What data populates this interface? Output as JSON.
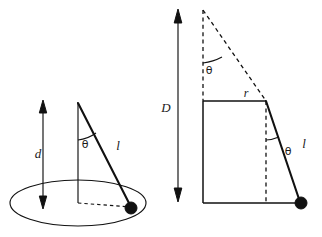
{
  "figure": {
    "background_color": "#ffffff",
    "ink_color": "#111111",
    "width": 322,
    "height": 237,
    "panels": [
      {
        "id": "left-panel",
        "name": "perspective-cone-view",
        "description": "Three-dimensional perspective view of a conical pendulum: a bob swings on a string of length l around a horizontal circular path, suspended a vertical depth d below the pivot, with the string making angle theta with the vertical axis.",
        "labels": [
          {
            "key": "depth",
            "text": "d",
            "kind": "italic-math",
            "x": 38,
            "y": 158
          },
          {
            "key": "angle",
            "text": "θ",
            "kind": "greek",
            "x": 85,
            "y": 148
          },
          {
            "key": "string",
            "text": "l",
            "kind": "italic-math",
            "x": 118,
            "y": 148
          }
        ]
      },
      {
        "id": "right-panel",
        "name": "side-elevation-view",
        "description": "Side elevation of the same conical pendulum showing the full cone depth D, the circular path radius r, the string length l and the apex half-angle theta repeated at the pivot and at the bob's vertical.",
        "labels": [
          {
            "key": "total-depth",
            "text": "D",
            "kind": "italic-math",
            "x": 166,
            "y": 110
          },
          {
            "key": "apex-angle",
            "text": "θ",
            "kind": "greek",
            "x": 206,
            "y": 72
          },
          {
            "key": "radius",
            "text": "r",
            "kind": "italic-math",
            "x": 246,
            "y": 98
          },
          {
            "key": "bob-angle",
            "text": "θ",
            "kind": "greek",
            "x": 287,
            "y": 155
          },
          {
            "key": "string",
            "text": "l",
            "kind": "italic-math",
            "x": 303,
            "y": 146
          }
        ]
      }
    ],
    "symbols": {
      "d": "d",
      "D": "D",
      "r": "r",
      "l": "l",
      "theta": "θ"
    }
  }
}
